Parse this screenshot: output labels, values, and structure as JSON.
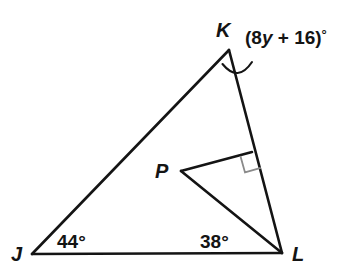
{
  "figure": {
    "type": "geometry-diagram",
    "background_color": "#ffffff",
    "stroke_color": "#141414",
    "right_angle_color": "#8a8a8a",
    "vertices": [
      {
        "name": "J",
        "label": "J",
        "x": 32,
        "y": 254,
        "label_x": 11,
        "label_y": 261
      },
      {
        "name": "K",
        "label": "K",
        "x": 229,
        "y": 50,
        "label_x": 216,
        "label_y": 37
      },
      {
        "name": "L",
        "label": "L",
        "x": 282,
        "y": 253,
        "label_x": 292,
        "label_y": 261
      },
      {
        "name": "P",
        "label": "P",
        "x": 181,
        "y": 171,
        "label_x": 155,
        "label_y": 178
      }
    ],
    "perpendicular_foot": {
      "x": 252,
      "y": 152
    },
    "segments": [
      {
        "name": "side-JK",
        "from": "J",
        "to": "K"
      },
      {
        "name": "side-KL",
        "from": "K",
        "to": "L"
      },
      {
        "name": "side-JL",
        "from": "J",
        "to": "L"
      },
      {
        "name": "segment-PL",
        "from": "P",
        "to": "L"
      },
      {
        "name": "segment-P-perpendicular",
        "from": "P",
        "to": "perpendicular_foot"
      }
    ],
    "angle_labels": [
      {
        "name": "angle-J",
        "text": "44°",
        "x": 57,
        "y": 248
      },
      {
        "name": "angle-L",
        "text": "38°",
        "x": 200,
        "y": 248
      }
    ],
    "angle_expression": {
      "name": "exterior-angle-K",
      "open_paren": "(",
      "coefficient": "8",
      "variable": "y",
      "operator": " + ",
      "constant": "16",
      "close_paren": ")",
      "degree": "°",
      "full_text": "(8y + 16)°",
      "x": 245,
      "y": 44
    },
    "right_angle_marker": {
      "name": "right-angle-square",
      "present": true,
      "x": 242,
      "y": 155,
      "size": 16
    },
    "arc_marker": {
      "name": "exterior-angle-arc",
      "present": true
    }
  }
}
